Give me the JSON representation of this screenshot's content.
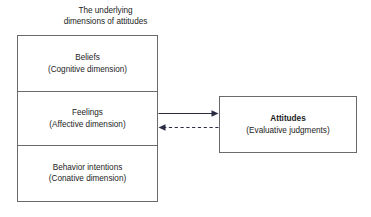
{
  "diagram": {
    "title": {
      "line1": "The underlying",
      "line2": "dimensions of attitudes"
    },
    "dimensions_box": {
      "cells": [
        {
          "title": "Beliefs",
          "subtitle": "(Cognitive dimension)"
        },
        {
          "title": "Feelings",
          "subtitle": "(Affective dimension)"
        },
        {
          "title": "Behavior intentions",
          "subtitle": "(Conative dimension)"
        }
      ]
    },
    "attitudes_box": {
      "title": "Attitudes",
      "subtitle": "(Evaluative judgments)"
    },
    "connectors": [
      {
        "name": "dimensions-to-attitudes-arrow",
        "style": "solid",
        "direction": "right"
      },
      {
        "name": "attitudes-to-dimensions-arrow",
        "style": "dashed",
        "direction": "left"
      }
    ],
    "colors": {
      "line": "#6a6a6a",
      "arrow": "#2b2b44",
      "text": "#1c1c1c",
      "background": "#ffffff"
    }
  }
}
